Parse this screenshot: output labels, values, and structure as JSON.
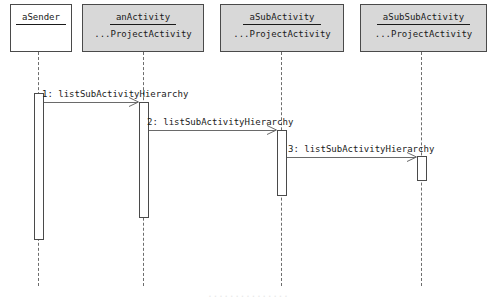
{
  "diagram": {
    "type": "uml-sequence-diagram",
    "participants": [
      {
        "name": "aSender",
        "classifier": "",
        "filled": false,
        "x": 38,
        "box_left": 10,
        "box_width": 62,
        "activation_top": 93,
        "activation_bottom": 240
      },
      {
        "name": "anActivity",
        "classifier": "...ProjectActivity",
        "filled": true,
        "x": 143,
        "box_left": 82,
        "box_width": 122,
        "activation_top": 102,
        "activation_bottom": 218
      },
      {
        "name": "aSubActivity",
        "classifier": "...ProjectActivity",
        "filled": true,
        "x": 281,
        "box_left": 220,
        "box_width": 124,
        "activation_top": 130,
        "activation_bottom": 196
      },
      {
        "name": "aSubSubActivity",
        "classifier": "...ProjectActivity",
        "filled": true,
        "x": 421,
        "box_left": 360,
        "box_width": 127,
        "activation_top": 156,
        "activation_bottom": 181
      }
    ],
    "messages": [
      {
        "label": "1: listSubActivityHierarchy",
        "from": 0,
        "to": 1,
        "y": 102,
        "label_x": 42,
        "label_y": 89
      },
      {
        "label": "2: listSubActivityHierarchy",
        "from": 1,
        "to": 2,
        "y": 130,
        "label_x": 147,
        "label_y": 117
      },
      {
        "label": "3: listSubActivityHierarchy",
        "from": 2,
        "to": 3,
        "y": 157,
        "label_x": 288,
        "label_y": 144
      }
    ],
    "lifeline_top": 52,
    "lifeline_bottom": 286,
    "box_top": 4,
    "box_height": 48,
    "clipped_caption": "...............",
    "colors": {
      "box_fill": "#d8d8d8",
      "box_fill_plain": "#ffffff",
      "border": "#4a4a4a",
      "line": "#6a6a6a",
      "text": "#1a1a1a"
    }
  }
}
